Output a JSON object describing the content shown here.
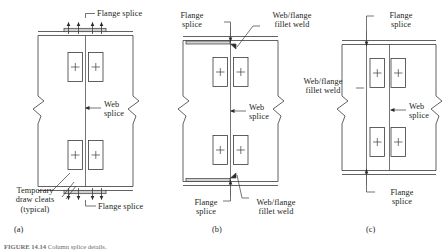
{
  "figure": {
    "caption_label": "FIGURE 14.14",
    "caption_text": "Column splice details."
  },
  "panels": [
    {
      "id": "a",
      "letter": "(a)",
      "labels": [
        {
          "name": "flange-splice-top",
          "text": "Flange splice"
        },
        {
          "name": "web-splice",
          "text": "Web\nsplice"
        },
        {
          "name": "temporary-draw-cleats",
          "text": "Temporary\ndraw cleats\n(typical)"
        },
        {
          "name": "flange-splice-bottom",
          "text": "Flange splice"
        }
      ]
    },
    {
      "id": "b",
      "letter": "(b)",
      "labels": [
        {
          "name": "flange-splice-top",
          "text": "Flange\nsplice"
        },
        {
          "name": "web-flange-fillet-weld-top",
          "text": "Web/flange\nfillet weld"
        },
        {
          "name": "web-splice",
          "text": "Web\nsplice"
        },
        {
          "name": "flange-splice-bottom",
          "text": "Flange\nsplice"
        },
        {
          "name": "web-flange-fillet-weld-bottom",
          "text": "Web/flange\nfillet weld"
        }
      ]
    },
    {
      "id": "c",
      "letter": "(c)",
      "labels": [
        {
          "name": "flange-splice-top",
          "text": "Flange\nsplice"
        },
        {
          "name": "web-flange-fillet-weld",
          "text": "Web/flange\nfillet weld"
        },
        {
          "name": "web-splice",
          "text": "Web\nsplice"
        },
        {
          "name": "flange-splice-bottom",
          "text": "Flange\nsplice"
        }
      ]
    }
  ],
  "colors": {
    "line": "#3a3a3c",
    "text": "#231f20",
    "caption": "#6f6f70",
    "background": "#ffffff"
  }
}
